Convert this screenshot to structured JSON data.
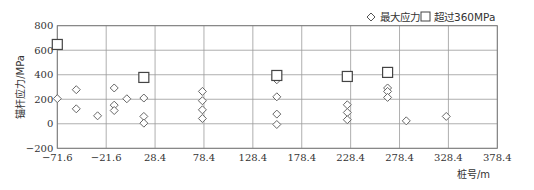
{
  "chart_data": {
    "type": "scatter",
    "title": "",
    "xlabel": "桩号/m",
    "ylabel": "锚杆应力/MPa",
    "xlim": [
      -71.6,
      378.4
    ],
    "ylim": [
      -200,
      800
    ],
    "xticks": [
      -71.6,
      -21.6,
      28.4,
      78.4,
      128.4,
      178.4,
      228.4,
      278.4,
      328.4,
      378.4
    ],
    "xtick_labels": [
      "−71.6",
      "−21.6",
      "28.4",
      "78.4",
      "128.4",
      "178.4",
      "228.4",
      "278.4",
      "328.4",
      "378.4"
    ],
    "yticks": [
      -200,
      0,
      200,
      400,
      600,
      800
    ],
    "ytick_labels": [
      "−200",
      "0",
      "200",
      "400",
      "600",
      "800"
    ],
    "grid": true,
    "legend_position": "top-right",
    "series": [
      {
        "name": "最大应力",
        "marker": "diamond",
        "color": "#666666",
        "points": [
          [
            -71.6,
            205
          ],
          [
            -52.2,
            278
          ],
          [
            -52.2,
            122
          ],
          [
            -30.4,
            65
          ],
          [
            -13.4,
            292
          ],
          [
            -13.4,
            152
          ],
          [
            -13.4,
            108
          ],
          [
            -0.5,
            204
          ],
          [
            16.9,
            210
          ],
          [
            16.9,
            60
          ],
          [
            16.9,
            5
          ],
          [
            76.8,
            264
          ],
          [
            76.8,
            188
          ],
          [
            76.8,
            114
          ],
          [
            76.8,
            43
          ],
          [
            152.9,
            359
          ],
          [
            152.9,
            220
          ],
          [
            152.9,
            79
          ],
          [
            152.9,
            -6
          ],
          [
            225.0,
            155
          ],
          [
            225.0,
            92
          ],
          [
            225.0,
            33
          ],
          [
            266.2,
            292
          ],
          [
            266.2,
            264
          ],
          [
            266.2,
            215
          ],
          [
            285.3,
            24
          ],
          [
            326.2,
            60
          ]
        ]
      },
      {
        "name": "超过360MPa",
        "marker": "square",
        "color": "#444444",
        "points": [
          [
            -71.6,
            647
          ],
          [
            16.9,
            378
          ],
          [
            152.9,
            394
          ],
          [
            225.0,
            386
          ],
          [
            266.2,
            419
          ]
        ]
      }
    ]
  }
}
